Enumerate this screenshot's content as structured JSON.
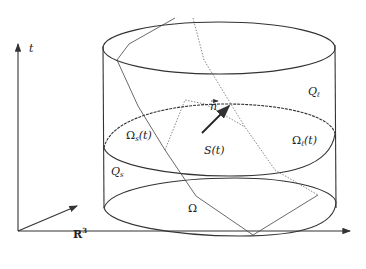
{
  "figure": {
    "axes": {
      "time_label": "t",
      "space_label": "R",
      "space_superscript": "3"
    },
    "regions": {
      "liquid_domain": "Q",
      "liquid_domain_sub": "ℓ",
      "solid_domain": "Q",
      "solid_domain_sub": "s",
      "solid_slice": "Ω",
      "solid_slice_sub": "s",
      "solid_slice_arg": "(t)",
      "liquid_slice": "Ω",
      "liquid_slice_sub": "ℓ",
      "liquid_slice_arg": "(t)",
      "interface": "S(t)",
      "base_domain": "Ω",
      "normal_vector": "n"
    }
  }
}
